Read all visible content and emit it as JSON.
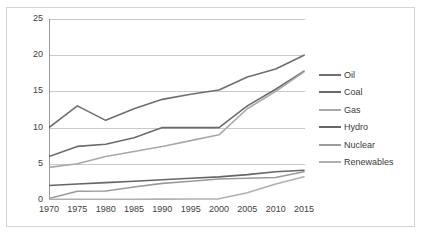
{
  "chart_data": {
    "type": "line",
    "title": "",
    "xlabel": "",
    "ylabel": "",
    "x": [
      1970,
      1975,
      1980,
      1985,
      1990,
      1995,
      2000,
      2005,
      2010,
      2015
    ],
    "xtick_labels": [
      "1970",
      "1975",
      "1980",
      "1985",
      "1990",
      "1995",
      "2000",
      "2005",
      "2010",
      "2015"
    ],
    "ytick_labels": [
      "0",
      "5",
      "10",
      "15",
      "20",
      "25"
    ],
    "ytick_values": [
      0,
      5,
      10,
      15,
      20,
      25
    ],
    "ylim": [
      0,
      25
    ],
    "grid": "horizontal",
    "legend_position": "right",
    "series": [
      {
        "name": "Oil",
        "color": "#6e6e6e",
        "values": [
          10.0,
          13.0,
          11.0,
          12.6,
          13.9,
          14.6,
          15.2,
          17.0,
          18.1,
          20.0
        ]
      },
      {
        "name": "Coal",
        "color": "#6b6b6b",
        "values": [
          6.0,
          7.4,
          7.7,
          8.6,
          10.0,
          10.0,
          10.0,
          13.0,
          15.3,
          17.8
        ]
      },
      {
        "name": "Gas",
        "color": "#a8a8a8",
        "values": [
          4.5,
          5.0,
          6.0,
          6.7,
          7.4,
          8.2,
          9.0,
          12.6,
          15.0,
          17.7
        ]
      },
      {
        "name": "Hydro",
        "color": "#666666",
        "values": [
          2.0,
          2.2,
          2.4,
          2.6,
          2.8,
          3.0,
          3.2,
          3.5,
          3.9,
          4.1
        ]
      },
      {
        "name": "Nuclear",
        "color": "#9b9b9b",
        "values": [
          0.2,
          1.2,
          1.25,
          1.8,
          2.3,
          2.6,
          2.9,
          3.0,
          3.1,
          3.9
        ]
      },
      {
        "name": "Renewables",
        "color": "#b0b0b0",
        "values": [
          0.1,
          0.1,
          0.1,
          0.1,
          0.12,
          0.14,
          0.16,
          1.0,
          2.2,
          3.2
        ]
      }
    ]
  },
  "legend": {
    "items": [
      {
        "label": "Oil"
      },
      {
        "label": "Coal"
      },
      {
        "label": "Gas"
      },
      {
        "label": "Hydro"
      },
      {
        "label": "Nuclear"
      },
      {
        "label": "Renewables"
      }
    ]
  },
  "colors": {
    "frame_border": "#d4d4d4",
    "axis_line": "#9a9a9a",
    "gridline": "#c9c9c9",
    "tick_text": "#404040",
    "background": "#ffffff"
  }
}
